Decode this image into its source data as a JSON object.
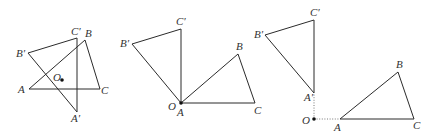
{
  "colors": {
    "line": "#2b2b2b",
    "label": "#333333",
    "point": "#111111",
    "background": "#ffffff"
  },
  "figures": [
    {
      "id": "figure-1",
      "description": "Triangle ABC rotated about interior point O to A'B'C'",
      "labels": {
        "A": "A",
        "B": "B",
        "C": "C",
        "A_prime": "A′",
        "B_prime": "B′",
        "C_prime": "C′",
        "O": "O"
      }
    },
    {
      "id": "figure-2",
      "description": "Triangle ABC rotated about vertex A (coincides with O) to A'B'C'",
      "labels": {
        "A": "A",
        "B": "B",
        "C": "C",
        "B_prime": "B′",
        "C_prime": "C′",
        "O": "O"
      }
    },
    {
      "id": "figure-3",
      "description": "Triangle ABC rotated about exterior point O to A'B'C', with dotted segments OA and OA'",
      "labels": {
        "A": "A",
        "B": "B",
        "C": "C",
        "A_prime": "A′",
        "B_prime": "B′",
        "C_prime": "C′",
        "O": "O"
      }
    }
  ]
}
